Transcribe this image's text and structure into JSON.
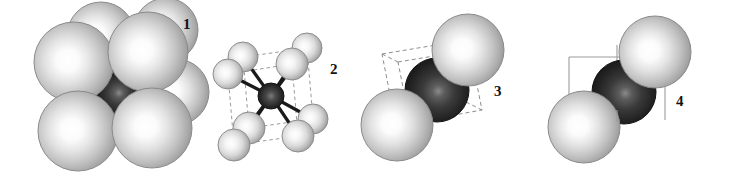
{
  "figure": {
    "kind": "crystal-structure-diagram",
    "width": 734,
    "height": 177,
    "background_color": "#ffffff"
  },
  "colors": {
    "sphere_light_core": "#ffffff",
    "sphere_light_mid": "#d8d8d8",
    "sphere_light_edge": "#9a9a9a",
    "sphere_light_rim": "#7d7d7d",
    "sphere_dark_core": "#6b6b6b",
    "sphere_dark_mid": "#3a3a3a",
    "sphere_dark_edge": "#1d1d1d",
    "sphere_dark_rim": "#121212",
    "bond_color": "#1a1a1a",
    "cell_edge_dashed": "#8e8e8e",
    "cell_edge_solid": "#9c9c9c",
    "label_color": "#111111"
  },
  "panels": [
    {
      "id": "panel-1",
      "label": "1",
      "label_x": 183,
      "label_y": 17,
      "style": "space-filling",
      "atoms_light": 8,
      "atoms_dark": 1,
      "cell_edges": "none"
    },
    {
      "id": "panel-2",
      "label": "2",
      "label_x": 330,
      "label_y": 62,
      "style": "ball-and-stick",
      "atoms_light": 8,
      "atoms_dark": 1,
      "cell_edges": "dashed"
    },
    {
      "id": "panel-3",
      "label": "3",
      "label_x": 494,
      "label_y": 84,
      "style": "diagonal-contact",
      "atoms_light": 2,
      "atoms_dark": 1,
      "cell_edges": "dashed"
    },
    {
      "id": "panel-4",
      "label": "4",
      "label_x": 676,
      "label_y": 94,
      "style": "diagonal-contact-plain",
      "atoms_light": 2,
      "atoms_dark": 1,
      "cell_edges": "solid-partial"
    }
  ],
  "geometry": {
    "panel1_light_spheres": [
      {
        "cx": 74,
        "cy": 62,
        "r": 40
      },
      {
        "cx": 148,
        "cy": 52,
        "r": 40
      },
      {
        "cx": 101,
        "cy": 36,
        "r": 34
      },
      {
        "cx": 166,
        "cy": 30,
        "r": 32
      },
      {
        "cx": 78,
        "cy": 131,
        "r": 40
      },
      {
        "cx": 152,
        "cy": 128,
        "r": 40
      },
      {
        "cx": 176,
        "cy": 92,
        "r": 33
      },
      {
        "cx": 108,
        "cy": 100,
        "r": 30
      }
    ],
    "panel1_dark_sphere": {
      "cx": 118,
      "cy": 92,
      "r": 23
    },
    "panel2_corners": [
      {
        "cx": 243,
        "cy": 57,
        "r": 15
      },
      {
        "cx": 307,
        "cy": 48,
        "r": 15
      },
      {
        "cx": 228,
        "cy": 74,
        "r": 15
      },
      {
        "cx": 292,
        "cy": 64,
        "r": 16
      },
      {
        "cx": 249,
        "cy": 128,
        "r": 16
      },
      {
        "cx": 313,
        "cy": 119,
        "r": 15
      },
      {
        "cx": 234,
        "cy": 145,
        "r": 16
      },
      {
        "cx": 298,
        "cy": 136,
        "r": 16
      }
    ],
    "panel2_center": {
      "cx": 271,
      "cy": 96,
      "r": 13
    },
    "panel3_cube": {
      "front": [
        [
          398,
          62
        ],
        [
          470,
          50
        ],
        [
          482,
          110
        ],
        [
          410,
          123
        ]
      ],
      "back": [
        [
          382,
          54
        ],
        [
          454,
          42
        ],
        [
          466,
          102
        ],
        [
          394,
          115
        ]
      ]
    },
    "panel3_light_spheres": [
      {
        "cx": 468,
        "cy": 50,
        "r": 36
      },
      {
        "cx": 397,
        "cy": 125,
        "r": 36
      }
    ],
    "panel3_dark_sphere": {
      "cx": 437,
      "cy": 90,
      "r": 32
    },
    "panel4_light_spheres": [
      {
        "cx": 655,
        "cy": 52,
        "r": 36
      },
      {
        "cx": 584,
        "cy": 127,
        "r": 36
      }
    ],
    "panel4_dark_sphere": {
      "cx": 624,
      "cy": 92,
      "r": 32
    },
    "panel4_lines": [
      {
        "x1": 569,
        "y1": 57,
        "x2": 660,
        "y2": 57
      },
      {
        "x1": 569,
        "y1": 57,
        "x2": 569,
        "y2": 106
      },
      {
        "x1": 617,
        "y1": 45,
        "x2": 617,
        "y2": 122
      },
      {
        "x1": 665,
        "y1": 62,
        "x2": 665,
        "y2": 120
      }
    ]
  }
}
